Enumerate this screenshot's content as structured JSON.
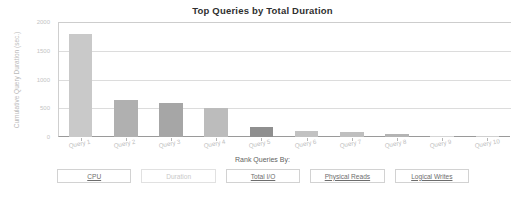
{
  "chart_data": {
    "type": "bar",
    "title": "Top Queries by Total Duration",
    "xlabel": "",
    "ylabel": "Cumulative Query Duration (sec.)",
    "categories": [
      "Query 1",
      "Query 2",
      "Query 3",
      "Query 4",
      "Query 5",
      "Query 6",
      "Query 7",
      "Query 8",
      "Query 9",
      "Query 10"
    ],
    "values": [
      1800,
      640,
      600,
      500,
      175,
      110,
      90,
      45,
      8,
      15
    ],
    "ylim": [
      0,
      2000
    ],
    "yticks": [
      0,
      500,
      1000,
      1500,
      2000
    ],
    "ytick_labels": [
      "0",
      "500",
      "1000",
      "1500",
      "2000"
    ],
    "grid": true,
    "legend": "none",
    "bar_colors": [
      "#c9c9c9",
      "#b0b0b0",
      "#a6a6a6",
      "#bcbcbc",
      "#8f8f8f",
      "#c2c2c2",
      "#bfbfbf",
      "#b4b4b4",
      "#d5d5d5",
      "#d0d0d0"
    ]
  },
  "footer": {
    "rank_label": "Rank Queries By:",
    "buttons": [
      {
        "label": "CPU",
        "state": "enabled"
      },
      {
        "label": "Duration",
        "state": "disabled"
      },
      {
        "label": "Total I/O",
        "state": "enabled"
      },
      {
        "label": "Physical Reads",
        "state": "enabled"
      },
      {
        "label": "Logical Writes",
        "state": "enabled"
      }
    ]
  }
}
